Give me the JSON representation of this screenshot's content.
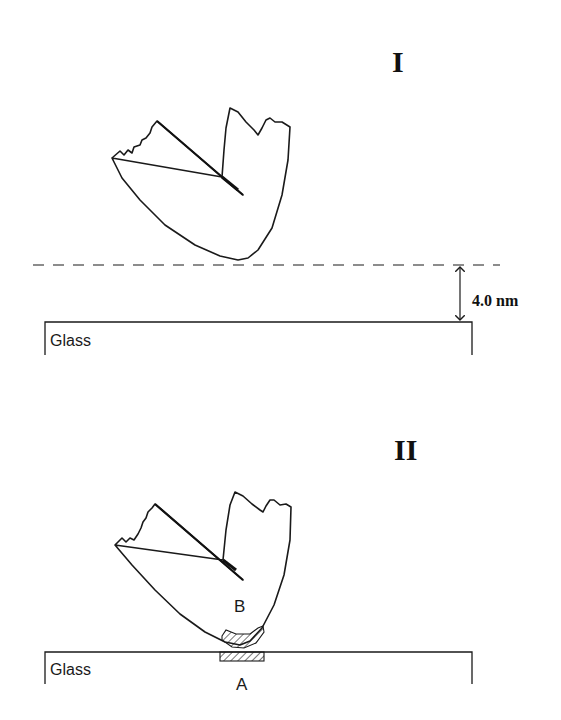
{
  "panels": [
    {
      "label": "I",
      "substrate_label": "Glass",
      "separation_label": "4.0 nm",
      "description": "Fractured particle positioned above glass surface, separated by 4.0 nm gap (dashed line)"
    },
    {
      "label": "II",
      "substrate_label": "Glass",
      "contact_labels": {
        "particle_region": "B",
        "substrate_region": "A"
      },
      "description": "Particle in contact with glass; hatched contact zones B (on particle) and A (on glass)"
    }
  ],
  "colors": {
    "line": "#1a1a1a",
    "background": "#ffffff"
  }
}
